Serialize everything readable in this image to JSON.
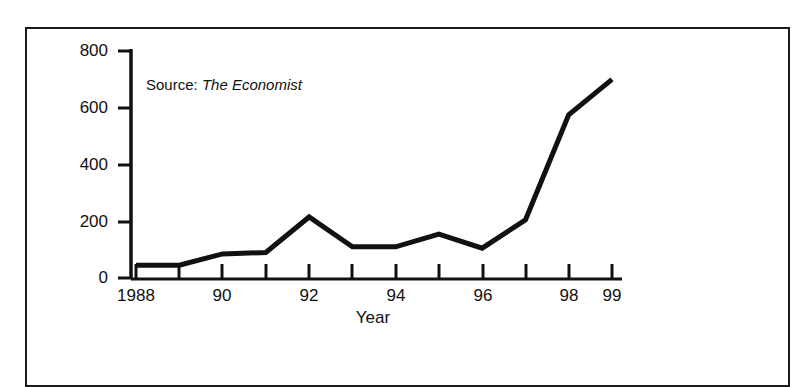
{
  "source_note": {
    "prefix": "Source:",
    "publication": "The Economist"
  },
  "chart_data": {
    "type": "line",
    "title": "",
    "subtitle": "",
    "xlabel": "Year",
    "ylabel": "",
    "legend": [],
    "legend_position": "none",
    "grid": false,
    "annotations": [
      "Source: The Economist"
    ],
    "x": [
      1988,
      1989,
      1990,
      1991,
      1992,
      1993,
      1994,
      1995,
      1996,
      1997,
      1998,
      1999
    ],
    "categories": [
      "1988",
      "89",
      "90",
      "91",
      "92",
      "93",
      "94",
      "95",
      "96",
      "97",
      "98",
      "99"
    ],
    "xtick_labels_shown": [
      "1988",
      "",
      "90",
      "",
      "92",
      "",
      "94",
      "",
      "96",
      "",
      "98",
      "99"
    ],
    "values": [
      45,
      45,
      85,
      90,
      215,
      110,
      110,
      155,
      105,
      205,
      575,
      700
    ],
    "ytick_labels": [
      "0",
      "200",
      "400",
      "600",
      "800"
    ],
    "yticks": [
      0,
      200,
      400,
      600,
      800
    ],
    "ylim": [
      0,
      800
    ],
    "xlim": [
      1988,
      1999
    ],
    "line_color": "#111111",
    "line_width": 5
  },
  "axis": {
    "x_title": "Year"
  }
}
